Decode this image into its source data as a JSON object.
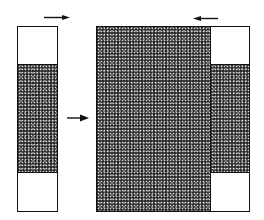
{
  "diagram": {
    "colors": {
      "fill_dark": "#2a2a2a",
      "outline": "#111111",
      "background": "#ffffff"
    },
    "left_column": {
      "sections": [
        "white",
        "dotted",
        "white"
      ],
      "top_arrow_direction": "right"
    },
    "center_arrow_direction": "right",
    "large_block": {
      "fill": "dotted"
    },
    "right_column": {
      "sections": [
        "white",
        "dotted",
        "white"
      ],
      "top_arrow_direction": "left"
    }
  }
}
